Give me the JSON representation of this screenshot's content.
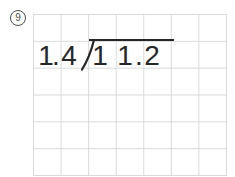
{
  "problem_number": "9",
  "division": {
    "divisor": "1.4",
    "dividend": "11.2",
    "expression": "1.4)11.2",
    "divisor_chars": [
      "1",
      ".",
      "4"
    ],
    "dividend_chars": [
      "1",
      "1",
      ".",
      "2"
    ]
  },
  "colors": {
    "ink": "#262626",
    "grid_line": "#d9dadb",
    "label": "#4b4b4b",
    "background": "#ffffff"
  }
}
